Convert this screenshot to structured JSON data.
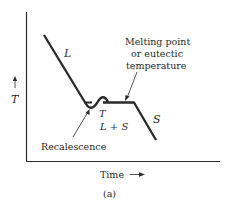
{
  "figure": {
    "caption": "(a)",
    "x_axis_label": "Time",
    "y_axis_label": "T",
    "region_labels": {
      "liquid": "L",
      "mixture_temp": "T",
      "mixture": "L + S",
      "solid": "S"
    },
    "annotations": {
      "melting_line1": "Melting point",
      "melting_line2": "or eutectic",
      "melting_line3": "temperature",
      "recalescence": "Recalescence"
    },
    "colors": {
      "line": "#2a2a2a",
      "background": "#ffffff"
    }
  }
}
